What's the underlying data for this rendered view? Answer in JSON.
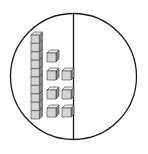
{
  "diagram": {
    "type": "base-ten-blocks",
    "colors": {
      "outline": "#1a1a1a",
      "cube_face": "#d4d4d4",
      "cube_top": "#eeeeee",
      "cube_side": "#8a8a8a",
      "cube_edge": "#3a3a3a",
      "background": "#ffffff"
    },
    "circle": {
      "cx": 73.5,
      "cy": 76.5,
      "r": 63
    },
    "divider": {
      "x": 73.5
    },
    "left_region": {
      "tens_rods": 1,
      "cubes_per_rod": 10,
      "ones_cubes": 7,
      "represented_value": 17
    },
    "right_region": {
      "tens_rods": 0,
      "ones_cubes": 0
    },
    "rod": {
      "x": 31,
      "y": 35,
      "cube_size": 8.4,
      "depth": 3
    },
    "ones_layout": [
      {
        "x": 47,
        "y": 53
      },
      {
        "x": 47,
        "y": 71
      },
      {
        "x": 62,
        "y": 71
      },
      {
        "x": 47,
        "y": 90
      },
      {
        "x": 62,
        "y": 90
      },
      {
        "x": 47,
        "y": 108
      },
      {
        "x": 62,
        "y": 108
      }
    ],
    "unit_size": 9,
    "unit_depth": 3
  }
}
